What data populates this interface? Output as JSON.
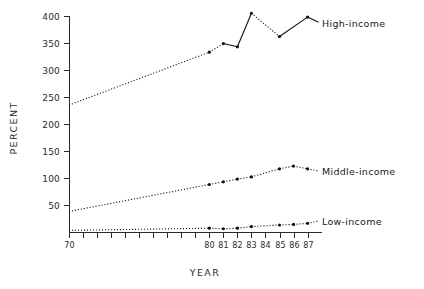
{
  "chart_data": {
    "type": "line",
    "title": "",
    "xlabel": "YEAR",
    "ylabel": "PERCENT",
    "xlim": [
      70,
      87.6
    ],
    "ylim": [
      0,
      410
    ],
    "grid": false,
    "legend_position": "right-inline-labels",
    "y_ticks": [
      50,
      100,
      150,
      200,
      250,
      300,
      350,
      400
    ],
    "y_tick_labels": [
      "50",
      "100",
      "150",
      "200",
      "250",
      "300",
      "350",
      "400"
    ],
    "x_ticks": [
      70,
      71,
      72,
      73,
      74,
      75,
      76,
      77,
      78,
      79,
      80,
      81,
      82,
      83,
      84,
      85,
      86,
      87
    ],
    "x_tick_labels": [
      "70",
      "",
      "",
      "",
      "",
      "",
      "",
      "",
      "",
      "",
      "80",
      "81",
      "82",
      "83",
      "84",
      "85",
      "86",
      "87"
    ],
    "series": [
      {
        "name": "High-income",
        "label": "High-income",
        "style": "mixed-dotted-solid",
        "x": [
          70,
          80,
          81,
          82,
          83,
          85,
          87
        ],
        "values": [
          235,
          333,
          349,
          343,
          405,
          362,
          398
        ]
      },
      {
        "name": "Middle-income",
        "label": "Middle-income",
        "style": "dotted",
        "x": [
          70,
          80,
          81,
          82,
          83,
          85,
          86,
          87
        ],
        "values": [
          38,
          88,
          93,
          98,
          102,
          117,
          122,
          117
        ]
      },
      {
        "name": "Low-income",
        "label": "Low-income",
        "style": "dotted",
        "x": [
          70,
          80,
          81,
          82,
          83,
          85,
          86,
          87
        ],
        "values": [
          3,
          7,
          6,
          7,
          10,
          13,
          14,
          16
        ]
      }
    ]
  },
  "axis": {
    "y_title": "PERCENT",
    "x_title": "YEAR"
  },
  "labels": {
    "high_income": "High-income",
    "middle_income": "Middle-income",
    "low_income": "Low-income"
  },
  "colors": {
    "ink": "#111111",
    "axis": "#2b2b2b",
    "background": "#ffffff"
  }
}
